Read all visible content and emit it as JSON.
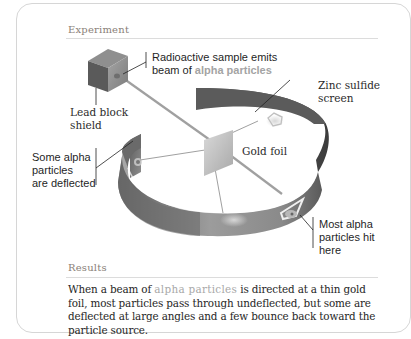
{
  "experiment": {
    "heading": "Experiment",
    "labels": {
      "source_line1": "Radioactive sample emits",
      "source_line2_prefix": "beam of ",
      "source_line2_accent": "alpha particles",
      "lead_line1": "Lead block",
      "lead_line2": "shield",
      "screen_line1": "Zinc sulfide",
      "screen_line2": "screen",
      "foil": "Gold foil",
      "deflected_line1": "Some alpha",
      "deflected_line2": "particles",
      "deflected_line3": "are deflected",
      "hit_line1": "Most alpha",
      "hit_line2": "particles hit",
      "hit_line3": "here"
    },
    "icons": {
      "lead_block": "lead-block-icon",
      "gold_foil": "gold-foil-icon",
      "screen": "zinc-sulfide-ring-icon"
    }
  },
  "results": {
    "heading": "Results",
    "text_prefix": "When a beam of ",
    "text_accent": "alpha particles",
    "text_suffix": " is directed at a thin gold foil, most particles pass through undeflected, but some are deflected at large angles and a few bounce back toward the particle source."
  },
  "colors": {
    "accent_text": "#a4a4a4",
    "heading_text": "#8a7f78",
    "screen_dark": "#555555",
    "screen_light": "#9a9a9a",
    "border": "#d6d6d6"
  }
}
